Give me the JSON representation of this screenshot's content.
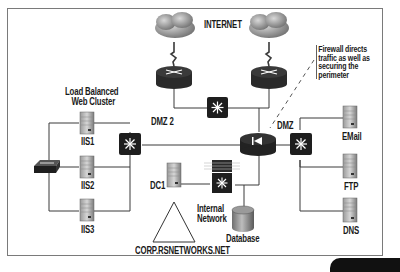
{
  "diagram": {
    "title": "CORP.RSNETWORKS.NET",
    "labels": {
      "internet": "INTERNET",
      "callout": [
        "Firewall directs",
        "traffic as well as",
        "securing the",
        "perimeter"
      ],
      "web_cluster": [
        "Load Balanced",
        "Web Cluster"
      ],
      "dmz2": "DMZ 2",
      "dmz": "DMZ",
      "internal_network": [
        "Internal",
        "Network"
      ],
      "domain": "CORP.RSNETWORKS.NET"
    },
    "nodes": [
      {
        "id": "cloud1",
        "type": "cloud",
        "label": ""
      },
      {
        "id": "cloud2",
        "type": "cloud",
        "label": ""
      },
      {
        "id": "router1",
        "type": "router",
        "label": ""
      },
      {
        "id": "router2",
        "type": "router",
        "label": ""
      },
      {
        "id": "dmz2-switch",
        "type": "switch",
        "label": ""
      },
      {
        "id": "firewall",
        "type": "firewall",
        "label": ""
      },
      {
        "id": "dmz-switch",
        "type": "switch",
        "label": ""
      },
      {
        "id": "web-switch",
        "type": "switch",
        "label": ""
      },
      {
        "id": "load-balancer",
        "type": "hub",
        "label": ""
      },
      {
        "id": "iis1",
        "type": "server",
        "label": "IIS1"
      },
      {
        "id": "iis2",
        "type": "server",
        "label": "IIS2"
      },
      {
        "id": "iis3",
        "type": "server",
        "label": "IIS3"
      },
      {
        "id": "dc1",
        "type": "server",
        "label": "DC1"
      },
      {
        "id": "internal-switch",
        "type": "layer3-switch",
        "label": ""
      },
      {
        "id": "database",
        "type": "database",
        "label": "Database"
      },
      {
        "id": "email",
        "type": "server",
        "label": "EMail"
      },
      {
        "id": "ftp",
        "type": "server",
        "label": "FTP"
      },
      {
        "id": "dns",
        "type": "server",
        "label": "DNS"
      },
      {
        "id": "domain-triangle",
        "type": "domain",
        "label": "CORP.RSNETWORKS.NET"
      }
    ],
    "edges": [
      [
        "cloud1",
        "router1"
      ],
      [
        "cloud2",
        "router2"
      ],
      [
        "router1",
        "dmz2-switch"
      ],
      [
        "router2",
        "dmz2-switch"
      ],
      [
        "router2",
        "firewall"
      ],
      [
        "dmz2-switch",
        "web-switch"
      ],
      [
        "firewall",
        "dmz-switch"
      ],
      [
        "firewall",
        "internal-switch"
      ],
      [
        "web-switch",
        "iis1"
      ],
      [
        "web-switch",
        "iis2"
      ],
      [
        "web-switch",
        "iis3"
      ],
      [
        "load-balancer",
        "iis1"
      ],
      [
        "load-balancer",
        "iis2"
      ],
      [
        "load-balancer",
        "iis3"
      ],
      [
        "internal-switch",
        "dc1"
      ],
      [
        "internal-switch",
        "database"
      ],
      [
        "dmz-switch",
        "email"
      ],
      [
        "dmz-switch",
        "ftp"
      ],
      [
        "dmz-switch",
        "dns"
      ]
    ]
  }
}
